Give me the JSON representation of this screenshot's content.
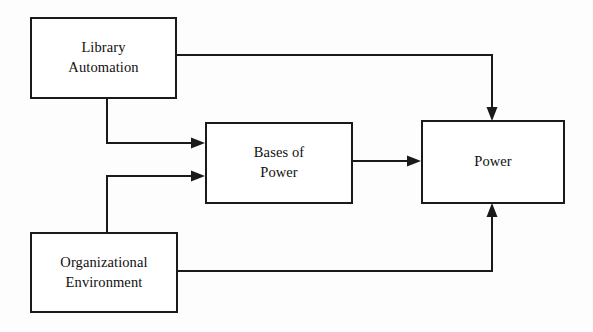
{
  "diagram": {
    "background_color": "#fdfdfd",
    "stroke_color": "#1a1a1a",
    "node_fill_color": "#ffffff",
    "nodes": [
      {
        "id": "library-automation",
        "label": "Library\nAutomation",
        "line1": "Library",
        "line2": "Automation"
      },
      {
        "id": "bases-of-power",
        "label": "Bases of\nPower",
        "line1": "Bases of",
        "line2": "Power"
      },
      {
        "id": "power",
        "label": "Power",
        "line1": "Power",
        "line2": ""
      },
      {
        "id": "organizational-environment",
        "label": "Organizational\nEnvironment",
        "line1": "Organizational",
        "line2": "Environment"
      }
    ],
    "edges": [
      {
        "id": "library-automation-to-power",
        "from": "library-automation",
        "to": "power",
        "label": "",
        "arrowhead": "down"
      },
      {
        "id": "library-automation-to-bases-of-power",
        "from": "library-automation",
        "to": "bases-of-power",
        "label": "",
        "arrowhead": "right"
      },
      {
        "id": "organizational-environment-to-bases-of-power",
        "from": "organizational-environment",
        "to": "bases-of-power",
        "label": "",
        "arrowhead": "right"
      },
      {
        "id": "bases-of-power-to-power",
        "from": "bases-of-power",
        "to": "power",
        "label": "",
        "arrowhead": "right"
      },
      {
        "id": "organizational-environment-to-power",
        "from": "organizational-environment",
        "to": "power",
        "label": "",
        "arrowhead": "up"
      }
    ]
  }
}
